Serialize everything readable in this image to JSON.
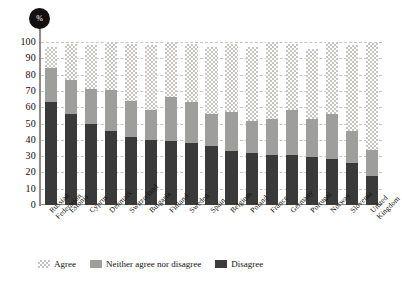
{
  "chart_data": {
    "type": "bar",
    "stacked": true,
    "title": "",
    "subtitle": "",
    "xlabel": "",
    "ylabel": "%",
    "unit_badge": "%",
    "ylim": [
      0,
      100
    ],
    "yticks": [
      0,
      10,
      20,
      30,
      40,
      50,
      60,
      70,
      80,
      90,
      100
    ],
    "ytick_labels": [
      "0",
      "10",
      "20",
      "30",
      "40",
      "50",
      "60",
      "70",
      "80",
      "90",
      "100"
    ],
    "grid": true,
    "grid_style": "dashed-horizontal",
    "legend_position": "bottom-left",
    "categories": [
      "Russian Federation",
      "Estonia",
      "Cyprus",
      "Denmark",
      "Switzerland",
      "Bulgaria",
      "Finland",
      "Sweden",
      "Spain",
      "Belgium",
      "Poland",
      "France",
      "Germany",
      "Portugal",
      "Norway",
      "Slovenia",
      "United Kingdom"
    ],
    "category_lines": [
      [
        "Russian",
        "Federation"
      ],
      [
        "Estonia"
      ],
      [
        "Cyprus"
      ],
      [
        "Denmark"
      ],
      [
        "Switzerland"
      ],
      [
        "Bulgaria"
      ],
      [
        "Finland"
      ],
      [
        "Sweden"
      ],
      [
        "Spain"
      ],
      [
        "Belgium"
      ],
      [
        "Poland"
      ],
      [
        "France"
      ],
      [
        "Germany"
      ],
      [
        "Portugal"
      ],
      [
        "Norway"
      ],
      [
        "Slovenia"
      ],
      [
        "United",
        "Kingdom"
      ]
    ],
    "series": [
      {
        "name": "Disagree",
        "color": "#3b3a3a",
        "pattern": "solid-dark",
        "values": [
          63,
          56,
          50,
          45.5,
          42,
          40,
          39.5,
          38,
          36,
          33,
          32,
          30.5,
          30.5,
          29.5,
          28,
          25.5,
          17.5
        ]
      },
      {
        "name": "Neither agree nor disagree",
        "color": "#9e9e9d",
        "pattern": "solid-gray",
        "values": [
          21,
          20.5,
          21,
          25,
          22,
          18,
          26.5,
          25,
          20,
          24,
          19.5,
          22,
          28,
          23,
          28,
          20,
          16
        ]
      },
      {
        "name": "Agree",
        "color": "#c6c5c4",
        "pattern": "checkered-light",
        "values": [
          13,
          22.5,
          27,
          29.5,
          35,
          40,
          34,
          36,
          41,
          42,
          45.5,
          47.5,
          40.5,
          43,
          44,
          52.5,
          66
        ]
      }
    ],
    "legend": [
      {
        "label": "Agree",
        "swatch": "checkered-light"
      },
      {
        "label": "Neither agree nor disagree",
        "swatch": "solid-gray"
      },
      {
        "label": "Disagree",
        "swatch": "solid-dark"
      }
    ]
  }
}
